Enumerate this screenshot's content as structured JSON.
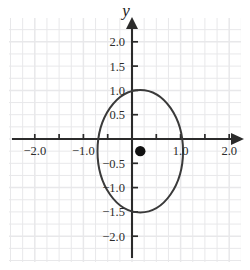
{
  "figure": {
    "axis_label_y": "y",
    "background": "#ffffff",
    "grid_color": "#e8e8ea",
    "axis_color": "#2b2b2b",
    "curve_color": "#3a3a3a",
    "point_color": "#111111"
  },
  "chart_data": {
    "type": "scatter",
    "title": "",
    "xlabel": "",
    "ylabel": "y",
    "grid": true,
    "legend": null,
    "xlim": [
      -2.55,
      2.45
    ],
    "ylim": [
      -2.45,
      2.6
    ],
    "xticks": [
      -2.0,
      -1.0,
      1.0,
      2.0
    ],
    "xtick_labels": [
      "-2.0",
      "-1.0",
      "1.0",
      "2.0"
    ],
    "yticks": [
      2.0,
      1.5,
      1.0,
      0.5,
      -0.5,
      -1.0,
      -1.5,
      -2.0
    ],
    "ytick_labels": [
      "2.0",
      "1.5",
      "1.0",
      "0.5",
      "-0.5",
      "-1.0",
      "-1.5",
      "-2.0"
    ],
    "minor_tick_step": 0.5,
    "grid_step": 0.25,
    "series": [
      {
        "name": "ellipse",
        "type": "ellipse",
        "center": [
          0.17,
          -0.25
        ],
        "semi_axis_x": 0.88,
        "semi_axis_y": 1.26,
        "rotation_deg": 0,
        "stroke": "#3a3a3a",
        "stroke_width": 2.0,
        "fill": "none",
        "extent_x": [
          -0.71,
          1.05
        ],
        "extent_y": [
          -1.51,
          1.01
        ]
      },
      {
        "name": "center-point",
        "type": "point",
        "x": 0.17,
        "y": -0.25,
        "marker": "filled-circle",
        "marker_size": 5.2,
        "color": "#111111"
      }
    ]
  },
  "ticks": {
    "x": [
      {
        "value": -2.0,
        "label": "-2.0",
        "labeled": true
      },
      {
        "value": -1.5,
        "label": "",
        "labeled": false
      },
      {
        "value": -1.0,
        "label": "-1.0",
        "labeled": true
      },
      {
        "value": -0.5,
        "label": "",
        "labeled": false
      },
      {
        "value": 0.5,
        "label": "",
        "labeled": false
      },
      {
        "value": 1.0,
        "label": "1.0",
        "labeled": true
      },
      {
        "value": 1.5,
        "label": "",
        "labeled": false
      },
      {
        "value": 2.0,
        "label": "2.0",
        "labeled": true
      }
    ],
    "y": [
      {
        "value": 2.0,
        "label": "2.0",
        "labeled": true
      },
      {
        "value": 1.5,
        "label": "1.5",
        "labeled": true
      },
      {
        "value": 1.0,
        "label": "1.0",
        "labeled": true
      },
      {
        "value": 0.5,
        "label": "0.5",
        "labeled": true
      },
      {
        "value": -0.5,
        "label": "-0.5",
        "labeled": true
      },
      {
        "value": -1.0,
        "label": "-1.0",
        "labeled": true
      },
      {
        "value": -1.5,
        "label": "-1.5",
        "labeled": true
      },
      {
        "value": -2.0,
        "label": "-2.0",
        "labeled": true
      }
    ]
  }
}
